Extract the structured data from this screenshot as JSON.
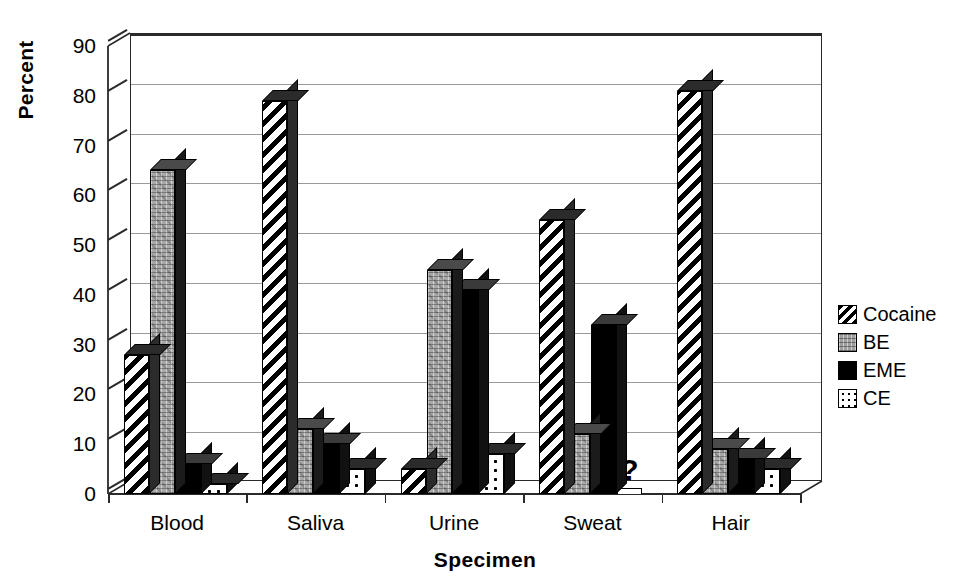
{
  "chart_data": {
    "type": "bar",
    "title": "",
    "xlabel": "Specimen",
    "ylabel": "Percent",
    "ylim": [
      0,
      90
    ],
    "yticks": [
      0,
      10,
      20,
      30,
      40,
      50,
      60,
      70,
      80,
      90
    ],
    "grid": true,
    "legend_position": "right",
    "categories": [
      "Blood",
      "Saliva",
      "Urine",
      "Sweat",
      "Hair"
    ],
    "series": [
      {
        "name": "Cocaine",
        "pattern": "diagonal-stripes",
        "values": [
          28,
          79,
          5,
          55,
          81
        ]
      },
      {
        "name": "BE",
        "pattern": "gray-texture",
        "values": [
          65,
          13,
          45,
          12,
          9
        ]
      },
      {
        "name": "EME",
        "pattern": "solid-black",
        "values": [
          6,
          10,
          41,
          34,
          7
        ]
      },
      {
        "name": "CE",
        "pattern": "dotted-light",
        "values": [
          2,
          5,
          8,
          null,
          5
        ]
      }
    ],
    "no_data_marker": "?",
    "no_data_note": "Sweat / CE has no data; marked with a question mark."
  },
  "axis": {
    "y_title": "Percent",
    "x_title": "Specimen"
  },
  "legend": {
    "items": [
      {
        "label": "Cocaine"
      },
      {
        "label": "BE"
      },
      {
        "label": "EME"
      },
      {
        "label": "CE"
      }
    ]
  }
}
